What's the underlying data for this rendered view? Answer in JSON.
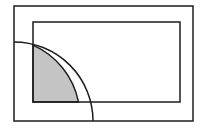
{
  "canvas": {
    "width": 205,
    "height": 133,
    "background": "#ffffff",
    "title": "Quarter circle overlapping two nested rectangles"
  },
  "style": {
    "stroke_color": "#1c1c1c",
    "stroke_width": 1.5,
    "shade_fill": "#c4c4c4",
    "shade_stroke": "#1c1c1c",
    "rect_fill": "none"
  },
  "shapes": {
    "outer_rectangle": {
      "label": "outer rectangle",
      "x": 14,
      "y": 6,
      "width": 179,
      "height": 115,
      "fill": "none",
      "stroke": "#1c1c1c"
    },
    "inner_rectangle": {
      "label": "inner rectangle",
      "x": 33,
      "y": 22,
      "width": 147,
      "height": 80,
      "fill": "none",
      "stroke": "#1c1c1c"
    },
    "quarter_circle": {
      "label": "quarter circle arc",
      "center_x": 14,
      "center_y": 121,
      "radius": 79,
      "start_x": 14,
      "start_y": 42,
      "end_x": 93,
      "end_y": 121,
      "stroke": "#1c1c1c",
      "fill": "none"
    },
    "shaded_region": {
      "label": "shaded intersection region",
      "fill": "#c4c4c4",
      "stroke": "#1c1c1c",
      "description": "intersection of the quarter circle and the inner rectangle",
      "left_x": 33,
      "right_x": 79,
      "top_y": 45,
      "bottom_y": 102,
      "path": "M 33 102 L 33 45.2 A 79 79 0 0 1 78.5 102 Z"
    }
  }
}
